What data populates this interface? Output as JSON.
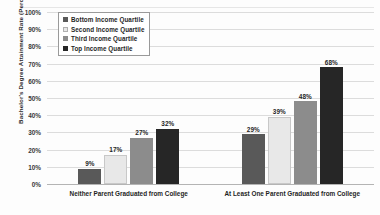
{
  "chart_data": {
    "type": "bar",
    "title": "",
    "subtitle": "",
    "xlabel": "",
    "ylabel": "Bachelor's Degree Attainment Rate (Percent)",
    "ylim": [
      0,
      100
    ],
    "grid": true,
    "legend_position": "top-left-inside",
    "y_ticks": [
      "0%",
      "10%",
      "20%",
      "30%",
      "40%",
      "50%",
      "60%",
      "70%",
      "80%",
      "90%",
      "100%"
    ],
    "y_tick_values": [
      0,
      10,
      20,
      30,
      40,
      50,
      60,
      70,
      80,
      90,
      100
    ],
    "categories": [
      "Neither Parent Graduated from College",
      "At Least One Parent Graduated from College"
    ],
    "series": [
      {
        "name": "Bottom Income Quartile",
        "color": "#595959",
        "values": [
          9,
          29
        ],
        "labels": [
          "9%",
          "29%"
        ]
      },
      {
        "name": "Second Income Quartile",
        "color": "#e8e8e8",
        "values": [
          17,
          39
        ],
        "labels": [
          "17%",
          "39%"
        ]
      },
      {
        "name": "Third Income Quartile",
        "color": "#8c8c8c",
        "values": [
          27,
          48
        ],
        "labels": [
          "27%",
          "48%"
        ]
      },
      {
        "name": "Top Income Quartile",
        "color": "#262626",
        "values": [
          32,
          68
        ],
        "labels": [
          "32%",
          "68%"
        ]
      }
    ]
  },
  "colors": {
    "gridline": "#dcdcdc",
    "baseline": "#b4b4b4",
    "text": "#1f1f1f",
    "background": "#fdfdfd",
    "legend_border": "#9a9a9a"
  }
}
